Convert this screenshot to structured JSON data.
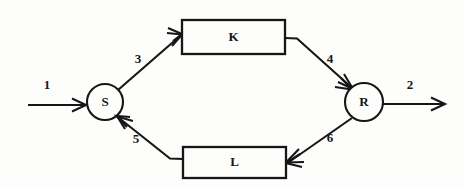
{
  "diagram": {
    "type": "block-diagram",
    "background_color": "#fdfdfb",
    "ink_color": "#161616",
    "nodes": [
      {
        "id": "S",
        "label": "S",
        "shape": "circle",
        "cx": 105,
        "cy": 102,
        "r": 18
      },
      {
        "id": "R",
        "label": "R",
        "shape": "circle",
        "cx": 364,
        "cy": 102,
        "r": 19
      },
      {
        "id": "K",
        "label": "K",
        "shape": "rect",
        "x": 182,
        "y": 20,
        "width": 103,
        "height": 34
      },
      {
        "id": "L",
        "label": "L",
        "shape": "rect",
        "x": 183,
        "y": 147,
        "width": 103,
        "height": 31
      }
    ],
    "edges": [
      {
        "id": "e1",
        "label": "1",
        "from": "input",
        "to": "S",
        "label_x": 47,
        "label_y": 86
      },
      {
        "id": "e3",
        "label": "3",
        "from": "S",
        "to": "K",
        "label_x": 138,
        "label_y": 60
      },
      {
        "id": "e4",
        "label": "4",
        "from": "K",
        "to": "R",
        "label_x": 330,
        "label_y": 60
      },
      {
        "id": "e2",
        "label": "2",
        "from": "R",
        "to": "output",
        "label_x": 410,
        "label_y": 86
      },
      {
        "id": "e6",
        "label": "6",
        "from": "R",
        "to": "L",
        "label_x": 330,
        "label_y": 139
      },
      {
        "id": "e5",
        "label": "5",
        "from": "L",
        "to": "S",
        "label_x": 136,
        "label_y": 140
      }
    ]
  }
}
